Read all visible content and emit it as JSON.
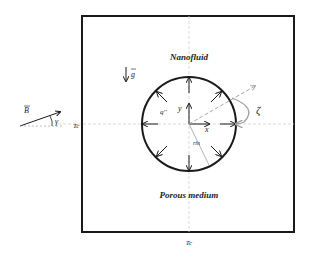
{
  "diagram": {
    "regions": {
      "upper_label": "Nanofluid",
      "lower_label": "Porous medium"
    },
    "symbols": {
      "gravity": "g",
      "magnetic_field": "B",
      "field_angle": "γ",
      "rotation_angle": "ζ",
      "heat_flux": "q''",
      "axis_x": "x",
      "axis_y": "y",
      "radius": "rin",
      "left_wall_temp": "Tc",
      "bottom_wall_temp": "Tc"
    },
    "colors": {
      "stroke": "#1a1a1a",
      "dashed": "#bfbfbf",
      "rotation_arrow": "#a0a0a0"
    }
  }
}
